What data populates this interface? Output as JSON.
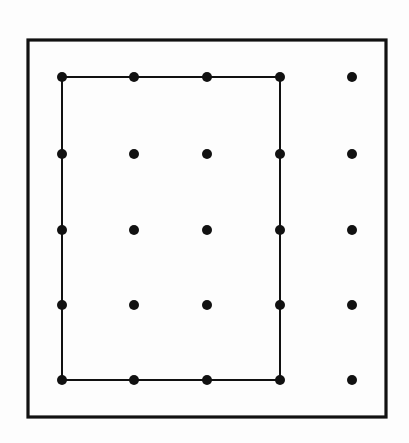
{
  "figure": {
    "canvas": {
      "width": 409,
      "height": 443,
      "background": "#fdfdfd"
    },
    "colors": {
      "stroke": "#111111",
      "dot_fill": "#111111",
      "background": "#fdfdfd",
      "frame": "#111111"
    }
  },
  "outer_frame": {
    "name": "outer-frame",
    "x": 28,
    "y": 40,
    "width": 358,
    "height": 377,
    "stroke_width": 3.2,
    "fill": "none"
  },
  "grid": {
    "columns": 5,
    "rows": 5,
    "column_x": [
      62,
      134,
      207,
      280,
      352
    ],
    "row_y": [
      77,
      154,
      230,
      305,
      380
    ],
    "dot_radius": 5.0,
    "dot_count": 25
  },
  "inner_rectangle": {
    "name": "inner-rectangle",
    "x": 62,
    "y": 77,
    "width": 218,
    "height": 303,
    "stroke_width": 2.0,
    "fill": "none",
    "spans_columns": [
      1,
      4
    ],
    "spans_rows": [
      1,
      5
    ]
  },
  "chart_data": {
    "type": "scatter",
    "xlabel": "",
    "ylabel": "",
    "xlim": [
      28,
      386
    ],
    "ylim": [
      40,
      417
    ],
    "grid": false,
    "legend": null,
    "annotations": [],
    "series": [
      {
        "name": "enclosed-dots",
        "marker": "filled-circle",
        "color": "#111111",
        "points": [
          {
            "x": 62,
            "y": 77
          },
          {
            "x": 134,
            "y": 77
          },
          {
            "x": 207,
            "y": 77
          },
          {
            "x": 280,
            "y": 77
          },
          {
            "x": 62,
            "y": 154
          },
          {
            "x": 134,
            "y": 154
          },
          {
            "x": 207,
            "y": 154
          },
          {
            "x": 280,
            "y": 154
          },
          {
            "x": 62,
            "y": 230
          },
          {
            "x": 134,
            "y": 230
          },
          {
            "x": 207,
            "y": 230
          },
          {
            "x": 280,
            "y": 230
          },
          {
            "x": 62,
            "y": 305
          },
          {
            "x": 134,
            "y": 305
          },
          {
            "x": 207,
            "y": 305
          },
          {
            "x": 280,
            "y": 305
          },
          {
            "x": 62,
            "y": 380
          },
          {
            "x": 134,
            "y": 380
          },
          {
            "x": 207,
            "y": 380
          },
          {
            "x": 280,
            "y": 380
          }
        ]
      },
      {
        "name": "outside-dots",
        "marker": "filled-circle",
        "color": "#111111",
        "points": [
          {
            "x": 352,
            "y": 77
          },
          {
            "x": 352,
            "y": 154
          },
          {
            "x": 352,
            "y": 230
          },
          {
            "x": 352,
            "y": 305
          },
          {
            "x": 352,
            "y": 380
          }
        ]
      }
    ],
    "shapes": [
      {
        "name": "outer-frame",
        "type": "rect",
        "x": 28,
        "y": 40,
        "width": 358,
        "height": 377,
        "stroke": "#111111",
        "stroke_width": 3.2,
        "fill": "none"
      },
      {
        "name": "inner-rectangle",
        "type": "rect",
        "x": 62,
        "y": 77,
        "width": 218,
        "height": 303,
        "stroke": "#111111",
        "stroke_width": 2.0,
        "fill": "none"
      }
    ]
  }
}
